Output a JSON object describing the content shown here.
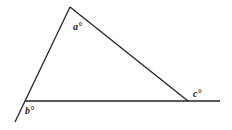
{
  "diagram": {
    "type": "triangle-angles",
    "labels": {
      "a": "a°",
      "b": "b°",
      "c": "c°"
    },
    "stroke_color": "#222222",
    "background": "#ffffff"
  }
}
